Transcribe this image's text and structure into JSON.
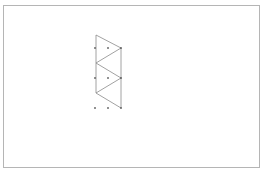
{
  "canvas": {
    "border_color": "#b5b5b5",
    "line_color": "#8a8a8a",
    "point_color": "#555555"
  },
  "diagram": {
    "type": "triangle-strip-on-dot-grid",
    "grid_points": [
      [
        95,
        48
      ],
      [
        108,
        48
      ],
      [
        121,
        48
      ],
      [
        95,
        78
      ],
      [
        108,
        78
      ],
      [
        121,
        78
      ],
      [
        95,
        108
      ],
      [
        108,
        108
      ],
      [
        121,
        108
      ]
    ],
    "lines": [
      [
        96,
        35,
        96,
        93
      ],
      [
        121,
        48,
        121,
        108
      ],
      [
        96,
        35,
        121,
        48
      ],
      [
        121,
        48,
        96,
        63
      ],
      [
        96,
        63,
        121,
        78
      ],
      [
        121,
        78,
        96,
        93
      ],
      [
        96,
        93,
        121,
        108
      ]
    ]
  }
}
